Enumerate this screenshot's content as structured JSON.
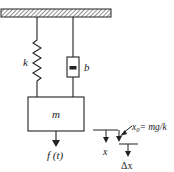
{
  "diagram": {
    "labels": {
      "spring": "k",
      "damper": "b",
      "mass": "m",
      "force": "f (t)",
      "x": "x",
      "x0_eq": "x",
      "x0_sub": "0",
      "x0_rhs": "= mg/k",
      "dx": "Δx"
    },
    "colors": {
      "line": "#222222",
      "hatch": "#555555",
      "background": "#ffffff"
    }
  }
}
